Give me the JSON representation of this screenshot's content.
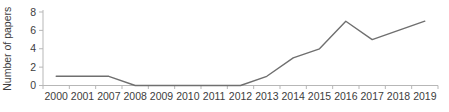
{
  "chart_data": {
    "type": "line",
    "title": "",
    "xlabel": "",
    "ylabel": "Number of papers",
    "categories": [
      "2000",
      "2001",
      "2007",
      "2008",
      "2009",
      "2010",
      "2011",
      "2012",
      "2013",
      "2014",
      "2015",
      "2016",
      "2017",
      "2018",
      "2019"
    ],
    "series": [
      {
        "name": "Number of papers",
        "values": [
          1,
          1,
          1,
          0,
          0,
          0,
          0,
          0,
          1,
          3,
          4,
          7,
          5,
          6,
          7
        ]
      }
    ],
    "ylim": [
      0,
      8
    ],
    "yticks": [
      0,
      2,
      4,
      6,
      8
    ],
    "grid": false,
    "legend_position": "none",
    "colors": {
      "line": "#6f6f6f",
      "axis": "#b7b7b7",
      "tick": "#b7b7b7",
      "text": "#3d3d3d"
    }
  }
}
